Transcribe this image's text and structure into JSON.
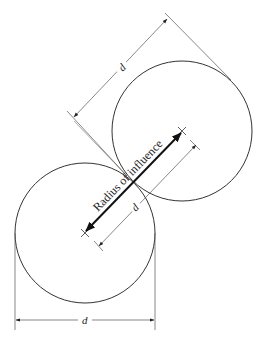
{
  "diagram": {
    "type": "engineering-dimension-drawing",
    "colors": {
      "stroke": "#333333",
      "thin": "#555555",
      "background": "#ffffff"
    },
    "circles": [
      {
        "id": "upper",
        "cx": 182,
        "cy": 131,
        "r": 70
      },
      {
        "id": "lower",
        "cx": 85,
        "cy": 233,
        "r": 70
      }
    ],
    "labels": {
      "top_dimension": "d",
      "inner_dimension": "d",
      "bottom_dimension": "d",
      "radius_arrow": "Radius of influence"
    }
  }
}
